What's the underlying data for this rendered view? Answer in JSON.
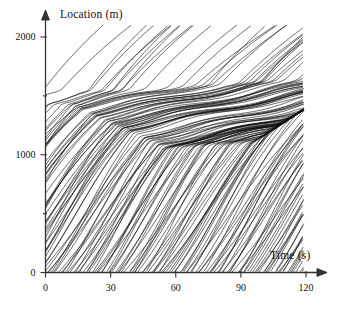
{
  "figure": {
    "name": "vehicle-trajectory-time-space-diagram",
    "background_color": "#ffffff",
    "line_color": "#111111"
  },
  "axes": {
    "y_axis": {
      "label": "Location (m)",
      "tick_labels": [
        "0",
        "1000",
        "2000"
      ],
      "tick_values": [
        0,
        1000,
        2000
      ],
      "minor_tick_values": [
        500,
        1500
      ],
      "range": [
        0,
        2150
      ],
      "arrow": true
    },
    "x_axis": {
      "label": "Time (s)",
      "tick_labels": [
        "0",
        "30",
        "60",
        "90",
        "120"
      ],
      "tick_values": [
        0,
        30,
        60,
        90,
        120
      ],
      "range": [
        0,
        128
      ],
      "arrow": true
    }
  },
  "chart_data": {
    "type": "line",
    "title": "",
    "xlabel": "Time (s)",
    "ylabel": "Location (m)",
    "xlim": [
      0,
      128
    ],
    "ylim": [
      0,
      2150
    ],
    "xticks": [
      0,
      30,
      60,
      90,
      120
    ],
    "yticks": [
      0,
      1000,
      2000
    ],
    "grid": false,
    "legend": null,
    "series_count": 160,
    "regions": [
      {
        "name": "free-flow-lower-left",
        "slope_m_per_s": 26,
        "location_range": [
          0,
          1000
        ],
        "time_range": [
          0,
          60
        ]
      },
      {
        "name": "congested-band",
        "slope_m_per_s": 4,
        "location_range": [
          1000,
          1500
        ],
        "time_range": [
          15,
          95
        ]
      },
      {
        "name": "recovery-upper-right",
        "slope_m_per_s": 22,
        "location_range": [
          1300,
          2100
        ],
        "time_range": [
          55,
          120
        ]
      }
    ],
    "series": [
      {
        "name": "trajectory-bundle",
        "entry_times": [
          -55,
          118
        ],
        "exit_location": 2100,
        "note": "each line is one vehicle's position over time"
      }
    ]
  }
}
